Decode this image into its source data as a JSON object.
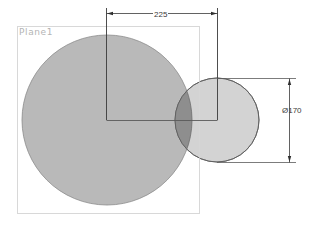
{
  "sketch": {
    "plane_label": "Plane1",
    "colors": {
      "background": "#ffffff",
      "plane_border": "#d8d8d8",
      "large_circle_fill": "#b9b9b9",
      "small_circle_fill": "#cfcfcf",
      "overlap_fill": "#8e8e8e",
      "outline": "#6e6e6e",
      "dimension_line": "#2f2f2f",
      "label_text": "#b4b4b4"
    },
    "plane": {
      "x": 17,
      "y": 26,
      "width": 182,
      "height": 187
    },
    "large_circle": {
      "cx": 107,
      "cy": 120,
      "r": 85
    },
    "small_circle": {
      "cx": 217,
      "cy": 120,
      "r": 42
    },
    "dimensions": {
      "center_distance": {
        "value": "225",
        "x1": 106,
        "x2": 217,
        "y": 13
      },
      "diameter": {
        "value": "Ø170",
        "x": 289,
        "y1": 78,
        "y2": 162
      }
    }
  }
}
